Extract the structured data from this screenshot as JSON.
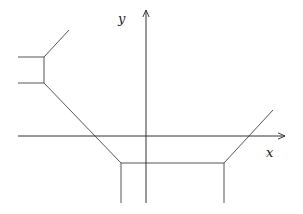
{
  "diagram": {
    "type": "tropical-curve-with-axes",
    "axes": {
      "x": {
        "label": "x",
        "from": [
          18,
          136
        ],
        "to": [
          285,
          136
        ]
      },
      "y": {
        "label": "y",
        "from": [
          146,
          203
        ],
        "to": [
          146,
          10
        ]
      }
    },
    "segments": [
      {
        "name": "upper-left-horizontal",
        "from": [
          18,
          57
        ],
        "to": [
          44,
          57
        ]
      },
      {
        "name": "lower-left-horizontal",
        "from": [
          18,
          83
        ],
        "to": [
          44,
          83
        ]
      },
      {
        "name": "left-vertical-connector",
        "from": [
          44,
          57
        ],
        "to": [
          44,
          83
        ]
      },
      {
        "name": "upper-left-diagonal",
        "from": [
          44,
          57
        ],
        "to": [
          69,
          30
        ]
      },
      {
        "name": "long-diagonal",
        "from": [
          44,
          83
        ],
        "to": [
          121,
          163
        ]
      },
      {
        "name": "bottom-horizontal",
        "from": [
          121,
          163
        ],
        "to": [
          224,
          163
        ]
      },
      {
        "name": "left-downward-vertical",
        "from": [
          121,
          163
        ],
        "to": [
          121,
          203
        ]
      },
      {
        "name": "right-downward-vertical",
        "from": [
          224,
          163
        ],
        "to": [
          224,
          203
        ]
      },
      {
        "name": "right-diagonal",
        "from": [
          224,
          163
        ],
        "to": [
          273,
          110
        ]
      }
    ],
    "colors": {
      "axis": "#333333",
      "curve": "#555555"
    }
  }
}
